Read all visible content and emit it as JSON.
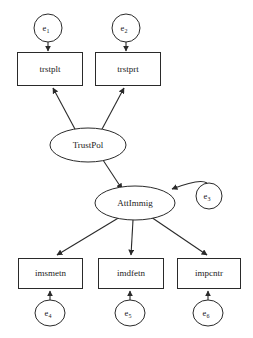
{
  "diagram": {
    "type": "sem-path-diagram",
    "title": "",
    "background_color": "#ffffff",
    "stroke_color": "#2a2a2a",
    "latent_variables": [
      {
        "id": "TrustPol",
        "label": "TrustPol",
        "shape": "ellipse",
        "cx": 88,
        "cy": 145,
        "rx": 38,
        "ry": 17
      },
      {
        "id": "AttImmig",
        "label": "AttImmig",
        "shape": "ellipse",
        "cx": 135,
        "cy": 203,
        "rx": 40,
        "ry": 17
      }
    ],
    "observed_variables": [
      {
        "id": "trstplt",
        "label": "trstplt",
        "shape": "rect",
        "x": 17,
        "y": 52,
        "w": 65,
        "h": 33
      },
      {
        "id": "trstprt",
        "label": "trstprt",
        "shape": "rect",
        "x": 95,
        "y": 52,
        "w": 65,
        "h": 33
      },
      {
        "id": "imsmetn",
        "label": "imsmetn",
        "shape": "rect",
        "x": 18,
        "y": 258,
        "w": 64,
        "h": 30
      },
      {
        "id": "imdfetn",
        "label": "imdfetn",
        "shape": "rect",
        "x": 98,
        "y": 258,
        "w": 65,
        "h": 30
      },
      {
        "id": "impcntr",
        "label": "impcntr",
        "shape": "rect",
        "x": 177,
        "y": 258,
        "w": 63,
        "h": 30
      }
    ],
    "error_terms": [
      {
        "id": "e1",
        "base": "e",
        "sub": "1",
        "cx": 48,
        "cy": 28,
        "rx": 14,
        "ry": 14,
        "target": "trstplt"
      },
      {
        "id": "e2",
        "base": "e",
        "sub": "2",
        "cx": 126,
        "cy": 28,
        "rx": 14,
        "ry": 14,
        "target": "trstprt"
      },
      {
        "id": "e3",
        "base": "e",
        "sub": "3",
        "cx": 209,
        "cy": 196,
        "rx": 13,
        "ry": 13,
        "target": "AttImmig"
      },
      {
        "id": "e4",
        "base": "e",
        "sub": "4",
        "cx": 50,
        "cy": 313,
        "rx": 15,
        "ry": 13,
        "target": "imsmetn"
      },
      {
        "id": "e5",
        "base": "e",
        "sub": "5",
        "cx": 130,
        "cy": 313,
        "rx": 15,
        "ry": 13,
        "target": "imdfetn"
      },
      {
        "id": "e6",
        "base": "e",
        "sub": "6",
        "cx": 208,
        "cy": 313,
        "rx": 15,
        "ry": 13,
        "target": "impcntr"
      }
    ],
    "paths": [
      {
        "from": "e1",
        "to": "trstplt",
        "kind": "directed"
      },
      {
        "from": "e2",
        "to": "trstprt",
        "kind": "directed"
      },
      {
        "from": "TrustPol",
        "to": "trstplt",
        "kind": "directed"
      },
      {
        "from": "TrustPol",
        "to": "trstprt",
        "kind": "directed"
      },
      {
        "from": "TrustPol",
        "to": "AttImmig",
        "kind": "directed"
      },
      {
        "from": "e3",
        "to": "AttImmig",
        "kind": "directed"
      },
      {
        "from": "AttImmig",
        "to": "imsmetn",
        "kind": "directed"
      },
      {
        "from": "AttImmig",
        "to": "imdfetn",
        "kind": "directed"
      },
      {
        "from": "AttImmig",
        "to": "impcntr",
        "kind": "directed"
      }
    ]
  }
}
